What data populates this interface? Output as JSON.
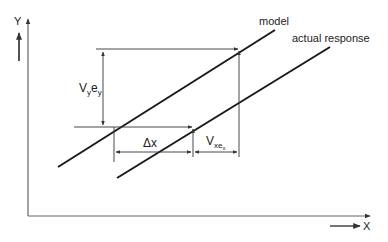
{
  "axes": {
    "y_label": "Y",
    "x_label": "X"
  },
  "curves": {
    "model_label": "model",
    "actual_label": "actual response"
  },
  "dimensions": {
    "vy_main": "V",
    "vy_sub": "y",
    "ey_main": "e",
    "ey_sub": "y",
    "dx_label": "Δx",
    "vx_main": "V",
    "vx_sub": "xe",
    "vx_subsub": "x"
  },
  "colors": {
    "ink": "#1a1a1a",
    "axis": "#555555"
  }
}
